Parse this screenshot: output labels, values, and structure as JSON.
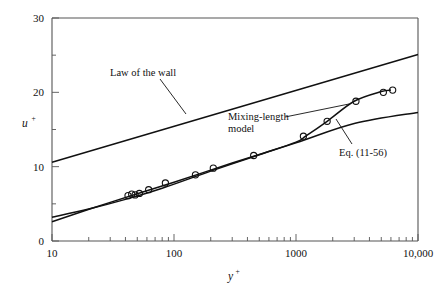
{
  "chart_data": {
    "type": "line",
    "title": "",
    "subtitle": "",
    "xlabel": "y+",
    "ylabel": "u+",
    "xscale": "log",
    "yscale": "linear",
    "xlim": [
      10,
      10000
    ],
    "ylim": [
      0,
      30
    ],
    "grid": false,
    "legend_position": "inline-annotations",
    "xticks": [
      10,
      100,
      1000,
      10000
    ],
    "xticklabels": [
      "10",
      "100",
      "1000",
      "10,000"
    ],
    "yticks": [
      0,
      10,
      20,
      30
    ],
    "yticklabels": [
      "0",
      "10",
      "20",
      "30"
    ],
    "yminorticks": [
      5,
      15,
      25
    ],
    "series": [
      {
        "name": "Law of the wall",
        "style": "solid-line",
        "x": [
          10,
          10000
        ],
        "values": [
          10.6,
          25.1
        ]
      },
      {
        "name": "Eq. (11-56)",
        "style": "solid-line",
        "x": [
          10,
          30,
          100,
          300,
          1000,
          3000,
          10000
        ],
        "values": [
          2.6,
          5.2,
          7.9,
          10.5,
          13.2,
          15.8,
          17.3
        ]
      },
      {
        "name": "Mixing-length model",
        "style": "solid-curve",
        "x": [
          10,
          20,
          40,
          80,
          200,
          500,
          1000,
          1200,
          1800,
          3000,
          5000,
          6000
        ],
        "values": [
          3.2,
          4.3,
          5.6,
          7.1,
          9.4,
          11.6,
          13.3,
          14.1,
          16.1,
          18.8,
          20.1,
          20.3
        ]
      },
      {
        "name": "data-points",
        "style": "open-circle-markers",
        "x": [
          42,
          45,
          48,
          52,
          62,
          85,
          150,
          210,
          450,
          1150,
          1800,
          3100,
          5200,
          6200
        ],
        "values": [
          6.1,
          6.3,
          6.2,
          6.4,
          6.9,
          7.8,
          8.9,
          9.8,
          11.5,
          14.1,
          16.1,
          18.8,
          20.0,
          20.3
        ]
      }
    ],
    "annotations": [
      {
        "id": "law-of-the-wall",
        "text": "Law of the wall",
        "lines": [
          "Law of the wall"
        ]
      },
      {
        "id": "mixing-length-model",
        "text": "Mixing-length model",
        "lines": [
          "Mixing-length",
          "model"
        ]
      },
      {
        "id": "eq-11-56",
        "text": "Eq. (11-56)",
        "lines": [
          "Eq.  (11-56)"
        ]
      }
    ]
  },
  "axis": {
    "y_label_base": "u",
    "y_label_sup": "+",
    "x_label_base": "y",
    "x_label_sup": "+"
  },
  "labels": {
    "y0": "0",
    "y10": "10",
    "y20": "20",
    "y30": "30",
    "x10": "10",
    "x100": "100",
    "x1000": "1000",
    "x10000": "10,000",
    "law_of_the_wall": "Law of the wall",
    "mixing_length_1": "Mixing-length",
    "mixing_length_2": "model",
    "eq_11_56": "Eq.  (11-56)"
  },
  "colors": {
    "ink": "#111111",
    "background": "#ffffff",
    "axis": "#555555",
    "curve": "#111111"
  }
}
